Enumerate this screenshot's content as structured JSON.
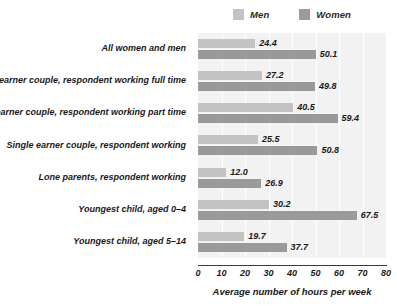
{
  "legend": {
    "position": "top-center",
    "items": [
      {
        "label": "Men",
        "color": "#c3c3c3",
        "swatch_name": "legend-swatch-men"
      },
      {
        "label": "Women",
        "color": "#9a9a9a",
        "swatch_name": "legend-swatch-women"
      }
    ]
  },
  "axis": {
    "title": "Average number of hours per week",
    "ticks": [
      "0",
      "10",
      "20",
      "30",
      "40",
      "50",
      "60",
      "70",
      "80"
    ]
  },
  "chart_data": {
    "type": "bar",
    "orientation": "horizontal",
    "title": "",
    "subtitle": "",
    "xlabel": "Average number of hours per week",
    "ylabel": "",
    "xlim": [
      0,
      80
    ],
    "xticks": [
      0,
      10,
      20,
      30,
      40,
      50,
      60,
      70,
      80
    ],
    "grid": true,
    "grid_axis": "x",
    "legend_position": "top-center",
    "categories": [
      "All women and men",
      "Dual earner couple, respondent working full time",
      "Dual earner couple, respondent working part time",
      "Single earner couple, respondent working",
      "Lone parents, respondent working",
      "Youngest child, aged 0–4",
      "Youngest child, aged 5–14"
    ],
    "series": [
      {
        "name": "Men",
        "color": "#c3c3c3",
        "values": [
          24.4,
          27.2,
          40.5,
          25.5,
          12.0,
          30.2,
          19.7
        ],
        "labels": [
          "24.4",
          "27.2",
          "40.5",
          "25.5",
          "12.0",
          "30.2",
          "19.7"
        ]
      },
      {
        "name": "Women",
        "color": "#9a9a9a",
        "values": [
          50.1,
          49.8,
          59.4,
          50.8,
          26.9,
          67.5,
          37.7
        ],
        "labels": [
          "50.1",
          "49.8",
          "59.4",
          "50.8",
          "26.9",
          "67.5",
          "37.7"
        ]
      }
    ]
  }
}
